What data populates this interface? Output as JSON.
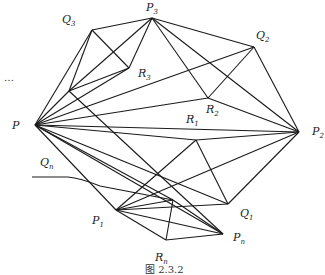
{
  "figure": {
    "caption": "图 2.3.2",
    "ellipsis": "…",
    "line_color": "#1a1a1a",
    "points": {
      "P": {
        "label": "P",
        "sub": "",
        "x": 35,
        "y": 125
      },
      "Q3": {
        "label": "Q",
        "sub": "3",
        "x": 92,
        "y": 30
      },
      "P3": {
        "label": "P",
        "sub": "3",
        "x": 152,
        "y": 18
      },
      "R3": {
        "label": "R",
        "sub": "3",
        "x": 129,
        "y": 68
      },
      "A": {
        "label": "",
        "sub": "",
        "x": 69,
        "y": 91
      },
      "Q2": {
        "label": "Q",
        "sub": "2",
        "x": 254,
        "y": 47
      },
      "R2": {
        "label": "R",
        "sub": "2",
        "x": 208,
        "y": 98
      },
      "P2": {
        "label": "P",
        "sub": "2",
        "x": 299,
        "y": 132
      },
      "R1": {
        "label": "R",
        "sub": "1",
        "x": 196,
        "y": 140
      },
      "Q1": {
        "label": "Q",
        "sub": "1",
        "x": 228,
        "y": 204
      },
      "B": {
        "label": "",
        "sub": "",
        "x": 173,
        "y": 200
      },
      "P1": {
        "label": "P",
        "sub": "1",
        "x": 116,
        "y": 210
      },
      "Pn": {
        "label": "P",
        "sub": "n",
        "x": 223,
        "y": 234
      },
      "Rn": {
        "label": "R",
        "sub": "n",
        "x": 166,
        "y": 240
      },
      "Qn": {
        "label": "Q",
        "sub": "n",
        "x": 32,
        "y": 177
      }
    },
    "labels": [
      {
        "text": "Q",
        "sub": "3",
        "x": 62,
        "y": 14
      },
      {
        "text": "P",
        "sub": "3",
        "x": 146,
        "y": 2
      },
      {
        "text": "R",
        "sub": "3",
        "x": 138,
        "y": 68
      },
      {
        "text": "Q",
        "sub": "2",
        "x": 256,
        "y": 30
      },
      {
        "text": "R",
        "sub": "2",
        "x": 206,
        "y": 104
      },
      {
        "text": "R",
        "sub": "1",
        "x": 186,
        "y": 114
      },
      {
        "text": "P",
        "sub": "2",
        "x": 312,
        "y": 126
      },
      {
        "text": "P",
        "sub": "",
        "x": 12,
        "y": 120
      },
      {
        "text": "Q",
        "sub": "n",
        "x": 40,
        "y": 157
      },
      {
        "text": "P",
        "sub": "1",
        "x": 92,
        "y": 215
      },
      {
        "text": "Q",
        "sub": "1",
        "x": 240,
        "y": 208
      },
      {
        "text": "P",
        "sub": "n",
        "x": 233,
        "y": 232
      },
      {
        "text": "R",
        "sub": "n",
        "x": 155,
        "y": 252
      }
    ]
  }
}
